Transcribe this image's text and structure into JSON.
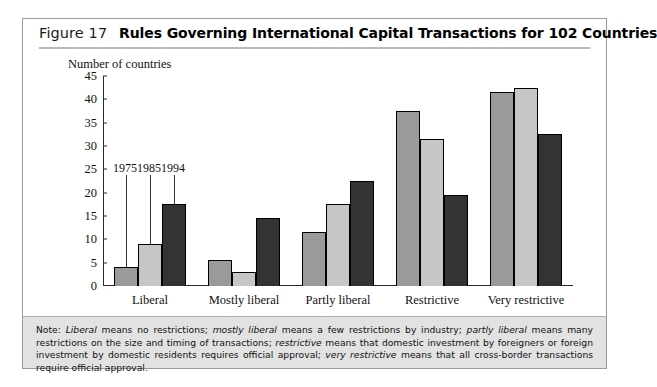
{
  "figure": {
    "number_label": "Figure 17",
    "title": "Rules Governing International Capital Transactions for 102 Countries"
  },
  "note": {
    "prefix": "Note:",
    "t1": " means no restrictions; ",
    "t2": " means a few restrictions by industry; ",
    "t3": " means many restrictions on the size and timing of transactions; ",
    "t4": " means that domestic investment by foreigners or foreign investment by domestic residents requires official approval; ",
    "t5": " means that all cross-border transactions require official approval.",
    "i1": "Liberal",
    "i2": "mostly liberal",
    "i3": "partly liberal",
    "i4": "restrictive",
    "i5": "very restrictive"
  },
  "colors": {
    "y1975": "#9a9a9a",
    "y1985": "#c6c6c6",
    "y1994": "#333333",
    "axis": "#2a2a2a",
    "note_band": "#e2e2e2"
  },
  "annotations": [
    {
      "label": "1975",
      "group": 0,
      "series": 0
    },
    {
      "label": "1985",
      "group": 0,
      "series": 1
    },
    {
      "label": "1994",
      "group": 0,
      "series": 2
    }
  ],
  "chart_data": {
    "type": "bar",
    "title": "Rules Governing International Capital Transactions for 102 Countries",
    "xlabel": "",
    "ylabel": "Number of countries",
    "ylim": [
      0,
      45
    ],
    "yticks": [
      0,
      5,
      10,
      15,
      20,
      25,
      30,
      35,
      40,
      45
    ],
    "grid": false,
    "legend": "none",
    "categories": [
      "Liberal",
      "Mostly liberal",
      "Partly liberal",
      "Restrictive",
      "Very restrictive"
    ],
    "series": [
      {
        "name": "1975",
        "values": [
          4,
          5.5,
          11.5,
          37.5,
          41.5
        ]
      },
      {
        "name": "1985",
        "values": [
          9,
          3,
          17.5,
          31.5,
          42.5
        ]
      },
      {
        "name": "1994",
        "values": [
          17.5,
          14.5,
          22.5,
          19.5,
          32.5
        ]
      }
    ]
  }
}
